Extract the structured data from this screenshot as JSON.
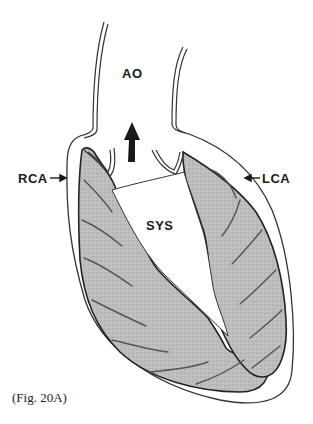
{
  "figure": {
    "labels": {
      "aorta": "AO",
      "right_coronary": "RCA",
      "left_coronary": "LCA",
      "phase": "SYS"
    },
    "caption": "(Fig. 20A)",
    "colors": {
      "outline": "#2a2a2a",
      "myocardium": "#b9b9b9",
      "vessel": "#555555",
      "background": "#ffffff"
    }
  }
}
